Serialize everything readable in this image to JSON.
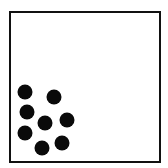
{
  "diagram": {
    "frame": {
      "border_color": "#111111",
      "fill": "#ffffff"
    },
    "dot_color": "#0a0a0a",
    "dot_count": 8,
    "dots": [
      {
        "x": 25,
        "y": 92
      },
      {
        "x": 54,
        "y": 97
      },
      {
        "x": 27,
        "y": 112
      },
      {
        "x": 45,
        "y": 123
      },
      {
        "x": 67,
        "y": 120
      },
      {
        "x": 25,
        "y": 133
      },
      {
        "x": 62,
        "y": 143
      },
      {
        "x": 42,
        "y": 148
      }
    ]
  }
}
